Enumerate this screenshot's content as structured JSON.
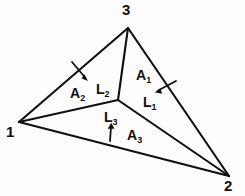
{
  "figure": {
    "type": "geometry-diagram",
    "background_color": "#fdfdfd",
    "stroke_color": "#101010",
    "vertices": [
      {
        "id": "vertex-1",
        "label": "1",
        "x": 19,
        "y": 122,
        "label_x": 6,
        "label_y": 126
      },
      {
        "id": "vertex-2",
        "label": "2",
        "x": 229,
        "y": 176,
        "label_x": 224,
        "label_y": 180
      },
      {
        "id": "vertex-3",
        "label": "3",
        "x": 128,
        "y": 28,
        "label_x": 122,
        "label_y": 3
      }
    ],
    "interior_point": {
      "id": "centroid-point",
      "x": 118,
      "y": 100
    },
    "edges": [
      {
        "id": "edge-1-3",
        "from": "vertex-1",
        "to": "vertex-3"
      },
      {
        "id": "edge-3-2",
        "from": "vertex-3",
        "to": "vertex-2"
      },
      {
        "id": "edge-1-2",
        "from": "vertex-1",
        "to": "vertex-2"
      },
      {
        "id": "cevian-1-center",
        "from": "vertex-1",
        "to": "interior_point"
      },
      {
        "id": "cevian-3-center",
        "from": "vertex-3",
        "to": "interior_point"
      },
      {
        "id": "cevian-2-center",
        "from": "vertex-2",
        "to": "interior_point"
      }
    ],
    "area_labels": [
      {
        "id": "area-1",
        "base": "A",
        "sub": "1",
        "x": 136,
        "y": 68
      },
      {
        "id": "area-2",
        "base": "A",
        "sub": "2",
        "x": 70,
        "y": 86
      },
      {
        "id": "area-3",
        "base": "A",
        "sub": "3",
        "x": 127,
        "y": 128
      }
    ],
    "length_labels": [
      {
        "id": "length-1",
        "base": "L",
        "sub": "1",
        "x": 143,
        "y": 95
      },
      {
        "id": "length-2",
        "base": "L",
        "sub": "2",
        "x": 96,
        "y": 82
      },
      {
        "id": "length-3",
        "base": "L",
        "sub": "3",
        "x": 104,
        "y": 110
      }
    ],
    "arrows": [
      {
        "id": "arrow-to-edge-1-3",
        "x1": 72,
        "y1": 62,
        "x2": 88,
        "y2": 81
      },
      {
        "id": "arrow-to-edge-3-2",
        "x1": 176,
        "y1": 81,
        "x2": 155,
        "y2": 92
      },
      {
        "id": "arrow-to-edge-1-2",
        "x1": 110,
        "y1": 141,
        "x2": 111,
        "y2": 123
      }
    ]
  }
}
